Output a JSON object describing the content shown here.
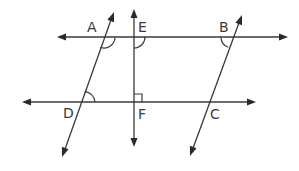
{
  "diagram": {
    "type": "geometry-parallel-lines",
    "colors": {
      "line": "#3a3a3a",
      "background": "#ffffff"
    },
    "lines": [
      {
        "name": "top-horizontal",
        "through": [
          "A",
          "E",
          "B"
        ],
        "x1": 57,
        "y1": 37,
        "x2": 288,
        "y2": 37,
        "arrows": [
          "start",
          "end"
        ]
      },
      {
        "name": "bottom-horizontal",
        "through": [
          "D",
          "F",
          "C"
        ],
        "x1": 22,
        "y1": 102,
        "x2": 256,
        "y2": 102,
        "arrows": [
          "start",
          "end"
        ]
      },
      {
        "name": "vertical-EF",
        "through": [
          "E",
          "F"
        ],
        "x1": 134,
        "y1": 9,
        "x2": 134,
        "y2": 147,
        "arrows": [
          "start",
          "end"
        ]
      },
      {
        "name": "transversal-AD",
        "through": [
          "A",
          "D"
        ],
        "x1": 114,
        "y1": 12,
        "x2": 62,
        "y2": 157,
        "arrows": [
          "start",
          "end"
        ]
      },
      {
        "name": "transversal-BC",
        "through": [
          "B",
          "C"
        ],
        "x1": 242,
        "y1": 15,
        "x2": 190,
        "y2": 156,
        "arrows": [
          "start",
          "end"
        ]
      }
    ],
    "points": [
      {
        "label": "A",
        "x": 104,
        "y": 37,
        "label_x": 87,
        "label_y": 32
      },
      {
        "label": "E",
        "x": 134,
        "y": 37,
        "label_x": 138,
        "label_y": 32
      },
      {
        "label": "B",
        "x": 232,
        "y": 37,
        "label_x": 219,
        "label_y": 32
      },
      {
        "label": "D",
        "x": 81,
        "y": 102,
        "label_x": 63,
        "label_y": 118
      },
      {
        "label": "F",
        "x": 134,
        "y": 102,
        "label_x": 138,
        "label_y": 119
      },
      {
        "label": "C",
        "x": 208,
        "y": 102,
        "label_x": 210,
        "label_y": 119
      }
    ],
    "angle_marks": [
      {
        "at": "A",
        "kind": "arc",
        "position": "below-right"
      },
      {
        "at": "E",
        "kind": "arc",
        "position": "below-right"
      },
      {
        "at": "B",
        "kind": "arc",
        "position": "below-left"
      },
      {
        "at": "D",
        "kind": "arc",
        "position": "above-right"
      },
      {
        "at": "F",
        "kind": "right-angle",
        "position": "above-right"
      }
    ]
  }
}
